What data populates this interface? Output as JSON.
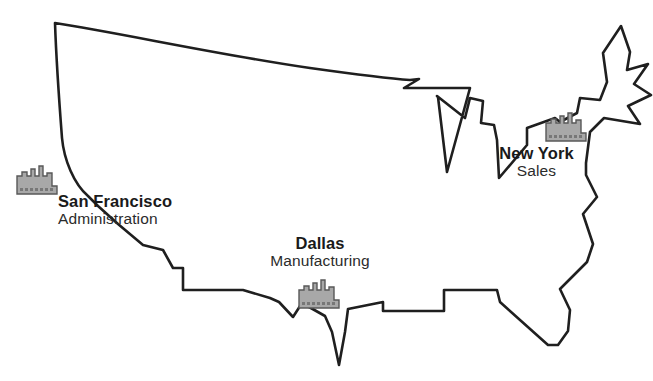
{
  "figure": {
    "type": "map-diagram",
    "background_color": "#ffffff",
    "outline_color": "#1f1f1f",
    "icon_fill_color": "#a8a8a8",
    "icon_stroke_color": "#585858",
    "label_color": "#1a1a1a"
  },
  "markers": [
    {
      "id": "san-francisco",
      "icon": "city-skyline-icon",
      "name": "San Francisco",
      "role": "Administration"
    },
    {
      "id": "dallas",
      "icon": "city-skyline-icon",
      "name": "Dallas",
      "role": "Manufacturing"
    },
    {
      "id": "new-york",
      "icon": "city-skyline-icon",
      "name": "New York",
      "role": "Sales"
    }
  ]
}
